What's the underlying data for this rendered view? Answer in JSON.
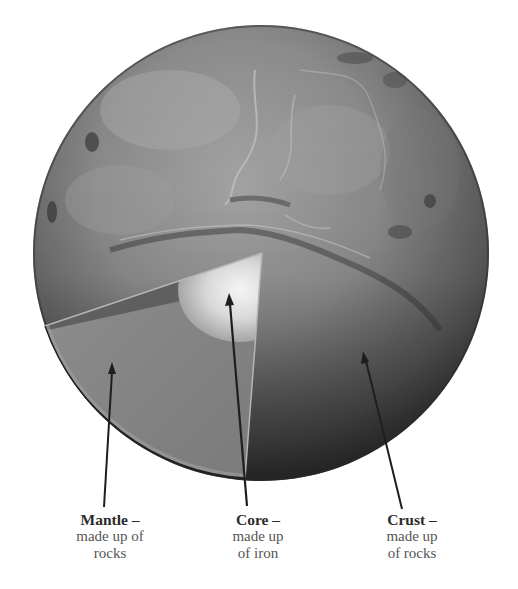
{
  "diagram": {
    "colors": {
      "background": "#ffffff",
      "planet_light": "#9a9a9a",
      "planet_dark": "#3a3a3a",
      "mantle": "#8a8a8a",
      "core_glow": "#f2f2f2",
      "arrow": "#1e1e1e",
      "text": "#3a3a3a"
    },
    "labels": [
      {
        "id": "mantle",
        "title": "Mantle –",
        "desc_line1": "made up of",
        "desc_line2": "rocks"
      },
      {
        "id": "core",
        "title": "Core –",
        "desc_line1": "made up",
        "desc_line2": "of iron"
      },
      {
        "id": "crust",
        "title": "Crust –",
        "desc_line1": "made up",
        "desc_line2": "of rocks"
      }
    ]
  }
}
